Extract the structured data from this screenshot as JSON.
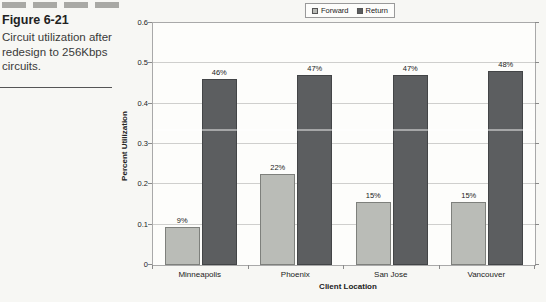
{
  "page": {
    "background": "#f7f7f4"
  },
  "sidebar": {
    "figure_label": "Figure 6-21",
    "caption": "Circuit utilization after redesign to 256Kbps circuits."
  },
  "chart_data": {
    "type": "bar",
    "title": "",
    "categories": [
      "Minneapolis",
      "Phoenix",
      "San Jose",
      "Vancouver"
    ],
    "series": [
      {
        "name": "Forward",
        "color": "#babcb7",
        "border": "#7e807c",
        "values": [
          0.095,
          0.225,
          0.155,
          0.155
        ],
        "labels": [
          "9%",
          "22%",
          "15%",
          "15%"
        ]
      },
      {
        "name": "Return",
        "color": "#5c5e60",
        "border": "#434547",
        "values": [
          0.46,
          0.47,
          0.47,
          0.48
        ],
        "labels": [
          "46%",
          "47%",
          "47%",
          "48%"
        ]
      }
    ],
    "xlabel": "Client Location",
    "ylabel": "Percent Utilization",
    "ylim": [
      0,
      0.6
    ],
    "ytick_step": 0.1,
    "yticks": [
      "0",
      "0.1",
      "0.2",
      "0.3",
      "0.4",
      "0.5",
      "0.6"
    ],
    "grid": true,
    "legend_position": "top-center",
    "gridline_color": "#cfcfcd",
    "plot_border_color": "#a9a9a9"
  }
}
